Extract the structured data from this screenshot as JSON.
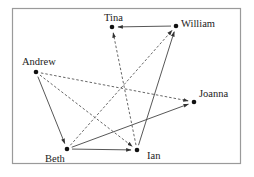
{
  "diagram": {
    "type": "directed-graph",
    "colors": {
      "node": "#111111",
      "edge": "#444444",
      "frame": "#9a9a9a",
      "label": "#222222"
    },
    "nodes": [
      {
        "id": "tina",
        "label": "Tina"
      },
      {
        "id": "william",
        "label": "William"
      },
      {
        "id": "andrew",
        "label": "Andrew"
      },
      {
        "id": "joanna",
        "label": "Joanna"
      },
      {
        "id": "beth",
        "label": "Beth"
      },
      {
        "id": "ian",
        "label": "Ian"
      }
    ],
    "edges": [
      {
        "from": "william",
        "to": "tina",
        "style": "solid"
      },
      {
        "from": "ian",
        "to": "william",
        "style": "solid"
      },
      {
        "from": "andrew",
        "to": "beth",
        "style": "solid"
      },
      {
        "from": "beth",
        "to": "ian",
        "style": "solid"
      },
      {
        "from": "beth",
        "to": "joanna",
        "style": "solid"
      },
      {
        "from": "andrew",
        "to": "joanna",
        "style": "dashed"
      },
      {
        "from": "andrew",
        "to": "ian",
        "style": "dashed"
      },
      {
        "from": "beth",
        "to": "william",
        "style": "dashed"
      },
      {
        "from": "ian",
        "to": "tina",
        "style": "dashed"
      }
    ]
  }
}
